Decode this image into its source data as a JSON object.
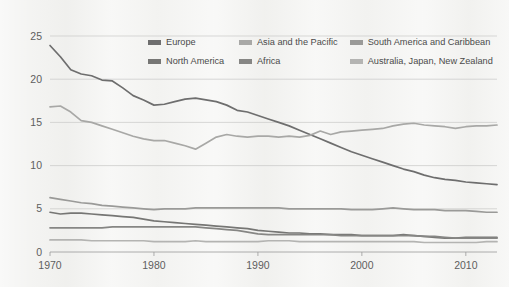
{
  "chart_data": {
    "type": "line",
    "title": "",
    "subtitle": "",
    "xlabel": "",
    "ylabel": "",
    "xlim": [
      1970,
      2013
    ],
    "ylim": [
      0,
      25
    ],
    "grid": true,
    "legend_position": "top-center",
    "y_ticks": [
      "0",
      "5",
      "10",
      "15",
      "20",
      "25"
    ],
    "y_tick_values": [
      0,
      5,
      10,
      15,
      20,
      25
    ],
    "x_ticks": [
      "1970",
      "1980",
      "1990",
      "2000",
      "2010"
    ],
    "x_tick_values": [
      1970,
      1980,
      1990,
      2000,
      2010
    ],
    "x": [
      1970,
      1971,
      1972,
      1973,
      1974,
      1975,
      1976,
      1977,
      1978,
      1979,
      1980,
      1981,
      1982,
      1983,
      1984,
      1985,
      1986,
      1987,
      1988,
      1989,
      1990,
      1991,
      1992,
      1993,
      1994,
      1995,
      1996,
      1997,
      1998,
      1999,
      2000,
      2001,
      2002,
      2003,
      2004,
      2005,
      2006,
      2007,
      2008,
      2009,
      2010,
      2011,
      2012,
      2013
    ],
    "series": [
      {
        "name": "Europe",
        "color": "#6e6e6e",
        "values": [
          23.9,
          22.6,
          21.1,
          20.6,
          20.4,
          19.9,
          19.8,
          19.0,
          18.1,
          17.6,
          17.0,
          17.1,
          17.4,
          17.7,
          17.8,
          17.6,
          17.4,
          17.0,
          16.4,
          16.2,
          15.8,
          15.4,
          15.0,
          14.6,
          14.1,
          13.6,
          13.1,
          12.6,
          12.1,
          11.6,
          11.2,
          10.8,
          10.4,
          10.0,
          9.6,
          9.3,
          8.9,
          8.6,
          8.4,
          8.3,
          8.1,
          8.0,
          7.9,
          7.8
        ]
      },
      {
        "name": "Asia and the Pacific",
        "color": "#a8a8a6",
        "values": [
          16.8,
          16.9,
          16.2,
          15.2,
          15.0,
          14.6,
          14.2,
          13.8,
          13.4,
          13.1,
          12.9,
          12.9,
          12.6,
          12.3,
          11.9,
          12.6,
          13.3,
          13.6,
          13.4,
          13.3,
          13.4,
          13.4,
          13.3,
          13.4,
          13.3,
          13.5,
          14.0,
          13.6,
          13.9,
          14.0,
          14.1,
          14.2,
          14.3,
          14.6,
          14.8,
          14.9,
          14.7,
          14.6,
          14.5,
          14.3,
          14.5,
          14.6,
          14.6,
          14.7
        ]
      },
      {
        "name": "South America and Caribbean",
        "color": "#9a9a98",
        "values": [
          6.3,
          6.1,
          5.9,
          5.7,
          5.6,
          5.4,
          5.3,
          5.2,
          5.1,
          5.0,
          4.9,
          5.0,
          5.0,
          5.0,
          5.1,
          5.1,
          5.1,
          5.1,
          5.1,
          5.1,
          5.1,
          5.1,
          5.1,
          5.0,
          5.0,
          5.0,
          5.0,
          5.0,
          5.0,
          4.9,
          4.9,
          4.9,
          5.0,
          5.1,
          5.0,
          4.9,
          4.9,
          4.9,
          4.8,
          4.8,
          4.8,
          4.7,
          4.6,
          4.6
        ]
      },
      {
        "name": "North America",
        "color": "#767674",
        "values": [
          4.6,
          4.4,
          4.5,
          4.5,
          4.4,
          4.3,
          4.2,
          4.1,
          4.0,
          3.8,
          3.6,
          3.5,
          3.4,
          3.3,
          3.2,
          3.1,
          3.0,
          2.9,
          2.8,
          2.7,
          2.5,
          2.4,
          2.3,
          2.2,
          2.2,
          2.1,
          2.1,
          2.0,
          2.0,
          2.0,
          1.9,
          1.9,
          1.9,
          1.9,
          2.0,
          1.9,
          1.8,
          1.7,
          1.6,
          1.6,
          1.7,
          1.7,
          1.7,
          1.7
        ]
      },
      {
        "name": "Africa",
        "color": "#868684",
        "values": [
          2.8,
          2.8,
          2.8,
          2.8,
          2.8,
          2.8,
          2.9,
          2.9,
          2.9,
          2.9,
          2.9,
          2.9,
          2.9,
          2.9,
          2.9,
          2.8,
          2.7,
          2.6,
          2.5,
          2.3,
          2.1,
          2.0,
          2.0,
          2.0,
          2.0,
          2.0,
          2.0,
          2.0,
          1.9,
          1.9,
          1.9,
          1.9,
          1.9,
          1.9,
          1.9,
          1.9,
          1.8,
          1.8,
          1.7,
          1.6,
          1.6,
          1.6,
          1.6,
          1.6
        ]
      },
      {
        "name": "Australia, Japan, New Zealand",
        "color": "#b4b4b2",
        "values": [
          1.4,
          1.4,
          1.4,
          1.4,
          1.3,
          1.3,
          1.3,
          1.3,
          1.3,
          1.3,
          1.2,
          1.2,
          1.2,
          1.2,
          1.3,
          1.2,
          1.2,
          1.2,
          1.2,
          1.2,
          1.2,
          1.3,
          1.3,
          1.3,
          1.2,
          1.2,
          1.2,
          1.2,
          1.2,
          1.2,
          1.2,
          1.2,
          1.2,
          1.2,
          1.2,
          1.2,
          1.1,
          1.1,
          1.1,
          1.1,
          1.1,
          1.1,
          1.2,
          1.2
        ]
      }
    ]
  },
  "legend": {
    "rows": [
      [
        {
          "label": "Europe",
          "color": "#6e6e6e",
          "width": 92
        },
        {
          "label": "Asia and the Pacific",
          "color": "#a8a8a6",
          "width": 112
        },
        {
          "label": "South America and Caribbean",
          "color": "#9a9a98",
          "width": 150
        }
      ],
      [
        {
          "label": "North America",
          "color": "#767674",
          "width": 92
        },
        {
          "label": "Africa",
          "color": "#868684",
          "width": 112
        },
        {
          "label": "Australia, Japan, New Zealand",
          "color": "#b4b4b2",
          "width": 150
        }
      ]
    ]
  },
  "theme": {
    "page_background": "#f2f2f0",
    "grid_color": "#c9c9c7",
    "axis_color": "#9b9b9b",
    "tick_text_color": "#5e5e5e",
    "legend_text_color": "#4a4a4a"
  }
}
